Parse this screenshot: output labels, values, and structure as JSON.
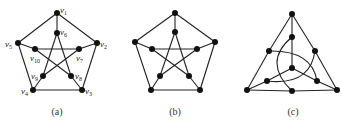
{
  "figure": {
    "panels": [
      {
        "id": "a",
        "caption": "(a)",
        "nodes": [
          {
            "id": "v1",
            "label": "v",
            "sub": "1",
            "x": 57,
            "y": 13,
            "lx": 60,
            "ly": 13
          },
          {
            "id": "v2",
            "label": "v",
            "sub": "2",
            "x": 97,
            "y": 43,
            "lx": 100,
            "ly": 47
          },
          {
            "id": "v3",
            "label": "v",
            "sub": "3",
            "x": 82,
            "y": 90,
            "lx": 85,
            "ly": 94
          },
          {
            "id": "v4",
            "label": "v",
            "sub": "4",
            "x": 33,
            "y": 90,
            "lx": 21,
            "ly": 94
          },
          {
            "id": "v5",
            "label": "v",
            "sub": "5",
            "x": 18,
            "y": 43,
            "lx": 5,
            "ly": 47
          },
          {
            "id": "v6",
            "label": "v",
            "sub": "6",
            "x": 57,
            "y": 33,
            "lx": 60,
            "ly": 35
          },
          {
            "id": "v7",
            "label": "v",
            "sub": "7",
            "x": 79,
            "y": 49,
            "lx": 76,
            "ly": 61
          },
          {
            "id": "v8",
            "label": "v",
            "sub": "8",
            "x": 71,
            "y": 76,
            "lx": 75,
            "ly": 79
          },
          {
            "id": "v9",
            "label": "v",
            "sub": "9",
            "x": 43,
            "y": 76,
            "lx": 31,
            "ly": 79
          },
          {
            "id": "v10",
            "label": "v",
            "sub": "10",
            "x": 35,
            "y": 49,
            "lx": 30,
            "ly": 61
          }
        ],
        "edges": [
          [
            "v1",
            "v2"
          ],
          [
            "v2",
            "v3"
          ],
          [
            "v3",
            "v4"
          ],
          [
            "v4",
            "v5"
          ],
          [
            "v5",
            "v1"
          ],
          [
            "v1",
            "v6"
          ],
          [
            "v2",
            "v7"
          ],
          [
            "v3",
            "v8"
          ],
          [
            "v4",
            "v9"
          ],
          [
            "v5",
            "v10"
          ],
          [
            "v6",
            "v8"
          ],
          [
            "v8",
            "v10"
          ],
          [
            "v10",
            "v7"
          ],
          [
            "v7",
            "v9"
          ],
          [
            "v9",
            "v6"
          ]
        ]
      },
      {
        "id": "b",
        "caption": "(b)",
        "nodes": [
          {
            "id": "o1",
            "x": 175,
            "y": 13
          },
          {
            "id": "o2",
            "x": 215,
            "y": 42
          },
          {
            "id": "o3",
            "x": 200,
            "y": 90
          },
          {
            "id": "o4",
            "x": 151,
            "y": 90
          },
          {
            "id": "o5",
            "x": 135,
            "y": 42
          },
          {
            "id": "i1",
            "x": 175,
            "y": 32
          },
          {
            "id": "i2",
            "x": 197,
            "y": 49
          },
          {
            "id": "i3",
            "x": 189,
            "y": 76
          },
          {
            "id": "i4",
            "x": 160,
            "y": 76
          },
          {
            "id": "i5",
            "x": 152,
            "y": 49
          }
        ],
        "edges": [
          [
            "o1",
            "o2"
          ],
          [
            "o2",
            "o3"
          ],
          [
            "o3",
            "o4"
          ],
          [
            "o4",
            "o5"
          ],
          [
            "o5",
            "o1"
          ],
          [
            "o1",
            "i1"
          ],
          [
            "o2",
            "i2"
          ],
          [
            "o3",
            "i3"
          ],
          [
            "o4",
            "i4"
          ],
          [
            "o5",
            "i5"
          ],
          [
            "i1",
            "i3"
          ],
          [
            "i3",
            "i5"
          ],
          [
            "i5",
            "i2"
          ],
          [
            "i2",
            "i4"
          ],
          [
            "i4",
            "i1"
          ]
        ]
      },
      {
        "id": "c",
        "caption": "(c)",
        "nodes": [
          {
            "id": "t",
            "x": 292,
            "y": 14
          },
          {
            "id": "bl",
            "x": 247,
            "y": 90
          },
          {
            "id": "br",
            "x": 337,
            "y": 90
          },
          {
            "id": "lm",
            "x": 269,
            "y": 51
          },
          {
            "id": "rm",
            "x": 315,
            "y": 51
          },
          {
            "id": "bm",
            "x": 292,
            "y": 91
          },
          {
            "id": "it",
            "x": 292,
            "y": 37
          },
          {
            "id": "il",
            "x": 267,
            "y": 81
          },
          {
            "id": "ir",
            "x": 317,
            "y": 81
          },
          {
            "id": "c",
            "x": 292,
            "y": 68
          }
        ],
        "edges": [
          [
            "t",
            "lm"
          ],
          [
            "lm",
            "bl"
          ],
          [
            "bl",
            "bm"
          ],
          [
            "bm",
            "br"
          ],
          [
            "br",
            "rm"
          ],
          [
            "rm",
            "t"
          ],
          [
            "t",
            "it"
          ],
          [
            "bl",
            "il"
          ],
          [
            "br",
            "ir"
          ],
          [
            "c",
            "it"
          ],
          [
            "c",
            "il"
          ],
          [
            "c",
            "ir"
          ]
        ],
        "arcs": [
          {
            "from": "it",
            "to": "bm",
            "d": "M292,37 Q262,62 292,91"
          },
          {
            "from": "lm",
            "to": "ir",
            "d": "M269,51 Q312,50 317,81"
          },
          {
            "from": "rm",
            "to": "il",
            "d": "M315,51 Q310,86 267,81"
          }
        ]
      }
    ]
  }
}
